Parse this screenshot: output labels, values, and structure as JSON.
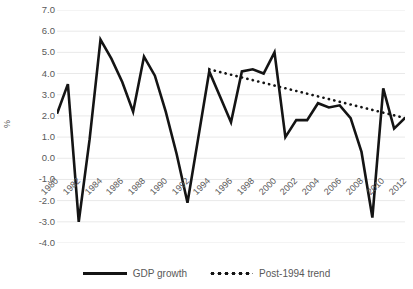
{
  "chart_data": {
    "type": "line",
    "title": "",
    "xlabel": "",
    "ylabel": "%",
    "ylim": [
      -4.0,
      7.0
    ],
    "ytick_step": 1.0,
    "ytick_labels": [
      "7.0",
      "6.0",
      "5.0",
      "4.0",
      "3.0",
      "2.0",
      "1.0",
      "0.0",
      "-1.0",
      "-2.0",
      "-3.0",
      "-4.0"
    ],
    "ytick_values": [
      7.0,
      6.0,
      5.0,
      4.0,
      3.0,
      2.0,
      1.0,
      0.0,
      -1.0,
      -2.0,
      -3.0,
      -4.0
    ],
    "grid": true,
    "grid_axis": "y",
    "legend_position": "bottom",
    "xlim": [
      1980,
      2012
    ],
    "xtick_labels": [
      "1980",
      "1982",
      "1984",
      "1986",
      "1988",
      "1990",
      "1992",
      "1994",
      "1996",
      "1998",
      "2000",
      "2002",
      "2004",
      "2006",
      "2008",
      "2010",
      "2012"
    ],
    "xtick_values": [
      1980,
      1982,
      1984,
      1986,
      1988,
      1990,
      1992,
      1994,
      1996,
      1998,
      2000,
      2002,
      2004,
      2006,
      2008,
      2010,
      2012
    ],
    "x": [
      1980,
      1981,
      1982,
      1983,
      1984,
      1985,
      1986,
      1987,
      1988,
      1989,
      1990,
      1991,
      1992,
      1993,
      1994,
      1995,
      1996,
      1997,
      1998,
      1999,
      2000,
      2001,
      2002,
      2003,
      2004,
      2005,
      2006,
      2007,
      2008,
      2009,
      2010,
      2011,
      2012
    ],
    "series": [
      {
        "name": "GDP growth",
        "style": "solid",
        "color": "#141414",
        "values": [
          2.1,
          3.5,
          -3.0,
          0.9,
          5.6,
          4.7,
          3.6,
          2.2,
          4.8,
          3.9,
          2.2,
          0.2,
          -2.1,
          1.0,
          4.1,
          2.9,
          1.7,
          4.1,
          4.2,
          4.0,
          5.0,
          1.0,
          1.8,
          1.8,
          2.6,
          2.4,
          2.5,
          1.9,
          0.3,
          -2.8,
          3.3,
          1.4,
          1.9
        ]
      },
      {
        "name": "Post-1994 trend",
        "style": "dotted",
        "color": "#141414",
        "x_start": 1994,
        "x_end": 2012,
        "y_start": 4.2,
        "y_end": 1.9
      }
    ],
    "legend": [
      {
        "label": "GDP growth",
        "style": "solid"
      },
      {
        "label": "Post-1994 trend",
        "style": "dotted"
      }
    ]
  }
}
